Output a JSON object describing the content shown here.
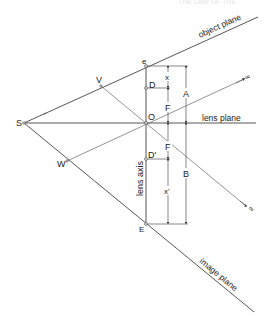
{
  "header": {
    "left": "",
    "right": "THE LAW OF THE"
  },
  "diagram": {
    "type": "optics / Scheimpflug geometry",
    "points": {
      "S": "S",
      "O": "O",
      "e": "e",
      "E": "E",
      "V": "V",
      "W": "W",
      "D": "D",
      "D_prime": "D'"
    },
    "planes": {
      "object": "object plane",
      "lens": "lens plane",
      "image": "image plane"
    },
    "axis": {
      "lens_axis": "lens axis"
    },
    "dimensions": {
      "x_top": "x",
      "F_top": "F",
      "A": "A",
      "F_bottom": "F",
      "x_bottom": "x'",
      "B": "B"
    },
    "infinity_upper": "∞",
    "infinity_lower": "∞"
  },
  "colors": {
    "line": "#444444",
    "background": "#ffffff"
  }
}
